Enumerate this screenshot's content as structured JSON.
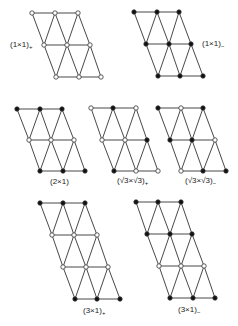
{
  "style": {
    "line_color": "#333333",
    "filled_color": "#111111",
    "open_fill": "#ffffff",
    "node_radius": 2.2,
    "line_width": 0.9
  },
  "legend_semantics": {
    "filled": "filled-circle",
    "open": "open-circle"
  },
  "diagrams": [
    {
      "id": "1x1-plus",
      "label": "(1×1)",
      "label_sub": "+",
      "label_pos": [
        10,
        41
      ],
      "rows": [
        {
          "y": 13,
          "x": [
            32,
            55,
            78
          ],
          "types": [
            "open",
            "open",
            "open"
          ]
        },
        {
          "y": 45,
          "x": [
            44,
            67,
            90
          ],
          "types": [
            "open",
            "open",
            "open"
          ]
        },
        {
          "y": 77,
          "x": [
            56,
            79,
            101
          ],
          "types": [
            "open",
            "open",
            "open"
          ]
        }
      ]
    },
    {
      "id": "1x1-minus",
      "label": "(1×1)",
      "label_sub": "−",
      "label_pos": [
        202,
        40
      ],
      "rows": [
        {
          "y": 12,
          "x": [
            134,
            157,
            179
          ],
          "types": [
            "filled",
            "filled",
            "filled"
          ]
        },
        {
          "y": 44,
          "x": [
            146,
            169,
            191
          ],
          "types": [
            "filled",
            "filled",
            "filled"
          ]
        },
        {
          "y": 76,
          "x": [
            158,
            180,
            203
          ],
          "types": [
            "filled",
            "filled",
            "filled"
          ]
        }
      ]
    },
    {
      "id": "2x1",
      "label": "(2×1)",
      "label_sub": "",
      "label_pos": [
        50,
        178
      ],
      "rows": [
        {
          "y": 109,
          "x": [
            17,
            40,
            62
          ],
          "types": [
            "filled",
            "filled",
            "filled"
          ]
        },
        {
          "y": 140,
          "x": [
            29,
            51,
            74
          ],
          "types": [
            "open",
            "open",
            "open"
          ]
        },
        {
          "y": 171,
          "x": [
            40,
            63,
            85
          ],
          "types": [
            "filled",
            "filled",
            "filled"
          ]
        }
      ]
    },
    {
      "id": "r3xr3-plus",
      "label": "(√3×√3)",
      "label_sub": "+",
      "label_pos": [
        117,
        177
      ],
      "rows": [
        {
          "y": 108,
          "x": [
            91,
            113,
            136
          ],
          "types": [
            "open",
            "filled",
            "open"
          ]
        },
        {
          "y": 140,
          "x": [
            102,
            125,
            147
          ],
          "types": [
            "open",
            "open",
            "filled"
          ]
        },
        {
          "y": 171,
          "x": [
            114,
            136,
            158
          ],
          "types": [
            "filled",
            "open",
            "open"
          ]
        }
      ]
    },
    {
      "id": "r3xr3-minus",
      "label": "(√3×√3)",
      "label_sub": "−",
      "label_pos": [
        185,
        177
      ],
      "rows": [
        {
          "y": 108,
          "x": [
            158,
            181,
            203
          ],
          "types": [
            "filled",
            "open",
            "filled"
          ]
        },
        {
          "y": 140,
          "x": [
            170,
            192,
            215
          ],
          "types": [
            "filled",
            "filled",
            "open"
          ]
        },
        {
          "y": 171,
          "x": [
            181,
            203,
            226
          ],
          "types": [
            "open",
            "filled",
            "filled"
          ]
        }
      ]
    },
    {
      "id": "3x1-plus",
      "label": "(3×1)",
      "label_sub": "+",
      "label_pos": [
        83,
        307
      ],
      "rows": [
        {
          "y": 203,
          "x": [
            40,
            63,
            85
          ],
          "types": [
            "filled",
            "filled",
            "filled"
          ]
        },
        {
          "y": 235,
          "x": [
            52,
            74,
            97
          ],
          "types": [
            "open",
            "open",
            "open"
          ]
        },
        {
          "y": 267,
          "x": [
            63,
            86,
            108
          ],
          "types": [
            "open",
            "open",
            "open"
          ]
        },
        {
          "y": 299,
          "x": [
            75,
            97,
            120
          ],
          "types": [
            "filled",
            "filled",
            "filled"
          ]
        }
      ]
    },
    {
      "id": "3x1-minus",
      "label": "(3×1)",
      "label_sub": "−",
      "label_pos": [
        178,
        306
      ],
      "rows": [
        {
          "y": 202,
          "x": [
            136,
            158,
            181
          ],
          "types": [
            "filled",
            "filled",
            "filled"
          ]
        },
        {
          "y": 234,
          "x": [
            147,
            170,
            192
          ],
          "types": [
            "filled",
            "filled",
            "filled"
          ]
        },
        {
          "y": 266,
          "x": [
            159,
            181,
            204
          ],
          "types": [
            "open",
            "open",
            "open"
          ]
        },
        {
          "y": 298,
          "x": [
            170,
            193,
            215
          ],
          "types": [
            "filled",
            "filled",
            "filled"
          ]
        }
      ]
    }
  ]
}
